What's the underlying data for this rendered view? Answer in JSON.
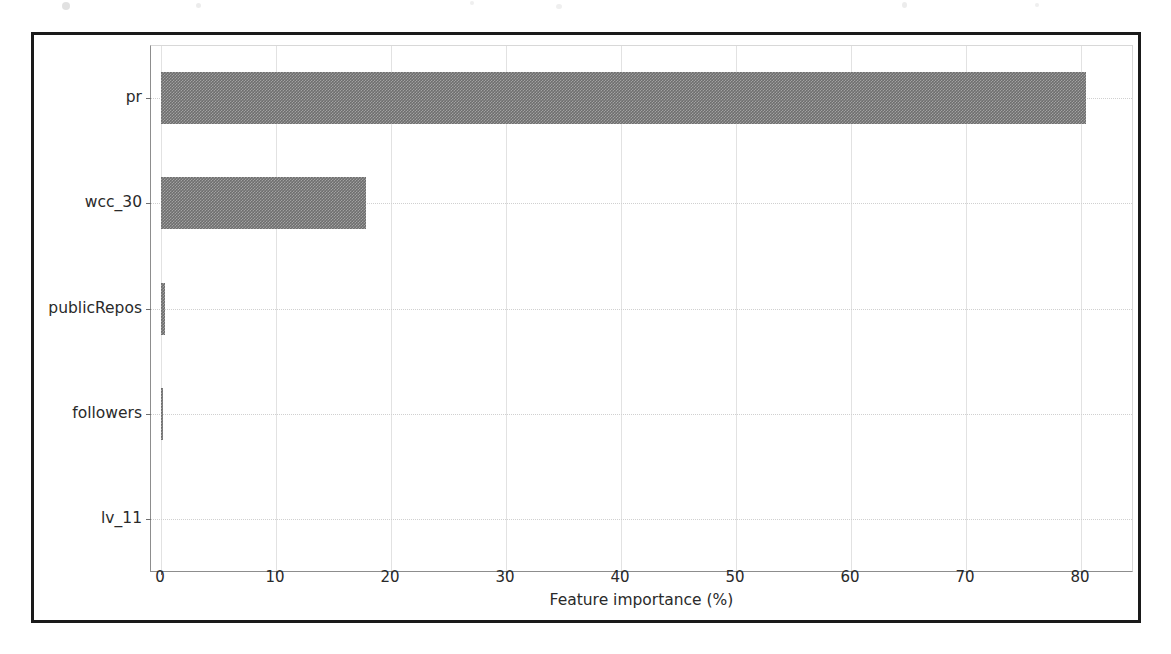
{
  "figure": {
    "background_color": "#ffffff",
    "frame_color": "#1a1a1a",
    "bar_color": "#6e6e6e",
    "grid_color": "#e2e2e2"
  },
  "chart_data": {
    "type": "bar",
    "orientation": "horizontal",
    "title": "",
    "xlabel": "Feature importance (%)",
    "ylabel": "",
    "categories": [
      "pr",
      "wcc_30",
      "publicRepos",
      "followers",
      "lv_11"
    ],
    "values": [
      81.3,
      18.0,
      0.35,
      0.18,
      0.0
    ],
    "xlim": [
      -0.9,
      85.5
    ],
    "xticks": [
      0,
      10,
      20,
      30,
      40,
      50,
      60,
      70,
      80
    ],
    "xticklabels": [
      "0",
      "10",
      "20",
      "30",
      "40",
      "50",
      "60",
      "70",
      "80"
    ],
    "yticklabels": [
      "pr",
      "wcc_30",
      "publicRepos",
      "followers",
      "lv_11"
    ],
    "grid": true,
    "grid_axis": "both",
    "legend": null
  }
}
